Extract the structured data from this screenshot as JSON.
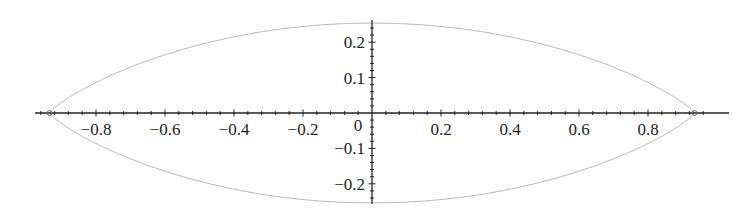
{
  "chart_data": {
    "type": "line",
    "title": "",
    "xlabel": "",
    "ylabel": "",
    "xlim": [
      -0.98,
      0.98
    ],
    "ylim": [
      -0.26,
      0.26
    ],
    "grid": false,
    "legend": null,
    "x_ticks": [
      -0.8,
      -0.6,
      -0.4,
      -0.2,
      0,
      0.2,
      0.4,
      0.6,
      0.8
    ],
    "x_tick_labels": [
      "−0.8",
      "−0.6",
      "−0.4",
      "−0.2",
      "0",
      "0.2",
      "0.4",
      "0.6",
      "0.8"
    ],
    "y_ticks": [
      0.2,
      0.1,
      -0.1,
      -0.2
    ],
    "y_tick_labels": [
      "0.2",
      "0.1",
      "−0.1",
      "−0.2"
    ],
    "series": [
      {
        "name": "closed lens-shaped curve",
        "description": "Symmetric closed curve through (±0.935, 0), max |y| ≈ 0.254 at x = 0",
        "x": [
          -0.935,
          -0.8,
          -0.6,
          -0.4,
          -0.2,
          0,
          0.2,
          0.4,
          0.6,
          0.8,
          0.935
        ],
        "y_upper": [
          0,
          0.085,
          0.16,
          0.212,
          0.243,
          0.254,
          0.243,
          0.212,
          0.16,
          0.085,
          0
        ],
        "y_lower": [
          0,
          -0.085,
          -0.16,
          -0.212,
          -0.243,
          -0.254,
          -0.243,
          -0.212,
          -0.16,
          -0.085,
          0
        ],
        "color": "#b8b8b8"
      }
    ],
    "markers": [
      {
        "x": -0.935,
        "y": 0,
        "shape": "circle"
      },
      {
        "x": 0.935,
        "y": 0,
        "shape": "circle"
      }
    ]
  },
  "colors": {
    "axis": "#222222",
    "curve": "#b8b8b8",
    "background": "#ffffff"
  }
}
